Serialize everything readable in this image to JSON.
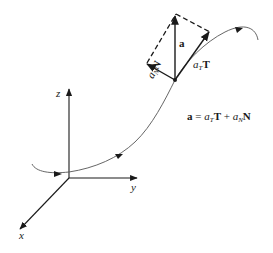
{
  "diagram": {
    "axes": {
      "x_label": "x",
      "y_label": "y",
      "z_label": "z"
    },
    "vectors": {
      "a_label": "a",
      "tangential": {
        "coef": "a",
        "sub": "T",
        "vec": "T"
      },
      "normal": {
        "coef": "a",
        "sub": "N",
        "vec": "N"
      }
    },
    "equation": {
      "lhs": "a",
      "eq": " = ",
      "t1_coef": "a",
      "t1_sub": "T",
      "t1_vec": "T",
      "plus": " + ",
      "t2_coef": "a",
      "t2_sub": "N",
      "t2_vec": "N"
    },
    "colors": {
      "ink": "#1a1a1a",
      "curve": "#555555"
    }
  }
}
